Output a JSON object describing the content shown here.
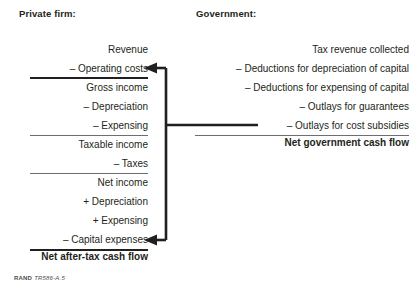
{
  "figure": {
    "private": {
      "header": "Private firm:",
      "rows": [
        {
          "label": "Revenue",
          "rule": "none"
        },
        {
          "label": "– Operating costs",
          "rule": "medium"
        },
        {
          "label": "Gross income",
          "rule": "none"
        },
        {
          "label": "– Depreciation",
          "rule": "none"
        },
        {
          "label": "– Expensing",
          "rule": "gray-thin"
        },
        {
          "label": "Taxable income",
          "rule": "none"
        },
        {
          "label": "– Taxes",
          "rule": "gray-thin"
        },
        {
          "label": "Net income",
          "rule": "none"
        },
        {
          "label": "+ Depreciation",
          "rule": "none"
        },
        {
          "label": "+ Expensing",
          "rule": "none"
        },
        {
          "label": "– Capital expenses",
          "rule": "thick"
        }
      ],
      "total": "Net after-tax cash flow"
    },
    "government": {
      "header": "Government:",
      "rows": [
        {
          "label": "Tax revenue collected",
          "rule": "none"
        },
        {
          "label": "– Deductions for depreciation of capital",
          "rule": "none"
        },
        {
          "label": "– Deductions for expensing of capital",
          "rule": "none"
        },
        {
          "label": "– Outlays for guarantees",
          "rule": "none"
        },
        {
          "label": "– Outlays for cost subsidies",
          "rule": "thin"
        }
      ],
      "total": "Net government cash flow"
    },
    "credit": {
      "org": "RAND",
      "id": "TR586-A.5"
    },
    "colors": {
      "ink": "#231f20",
      "rule_gray": "#6d6e71",
      "background": "#ffffff"
    }
  }
}
